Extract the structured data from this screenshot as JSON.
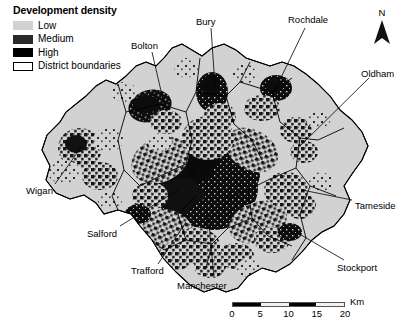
{
  "legend": {
    "title": "Development density",
    "items": [
      {
        "label": "Low",
        "swatch": "low-swatch",
        "color": "#d2d2d2"
      },
      {
        "label": "Medium",
        "swatch": "medium-swatch",
        "color": "#2a2a2a"
      },
      {
        "label": "High",
        "swatch": "high-swatch",
        "color": "#000000"
      },
      {
        "label": "District boundaries",
        "swatch": "boundary-swatch",
        "color": "#ffffff"
      }
    ]
  },
  "map": {
    "labels": [
      {
        "name": "bolton",
        "text": "Bolton"
      },
      {
        "name": "bury",
        "text": "Bury"
      },
      {
        "name": "rochdale",
        "text": "Rochdale"
      },
      {
        "name": "oldham",
        "text": "Oldham"
      },
      {
        "name": "tameside",
        "text": "Tameside"
      },
      {
        "name": "stockport",
        "text": "Stockport"
      },
      {
        "name": "manchester",
        "text": "Manchester"
      },
      {
        "name": "trafford",
        "text": "Trafford"
      },
      {
        "name": "salford",
        "text": "Salford"
      },
      {
        "name": "wigan",
        "text": "Wigan"
      }
    ]
  },
  "north_arrow": {
    "label": "N",
    "icon": "north-arrow-icon"
  },
  "scale_bar": {
    "unit": "Km",
    "ticks": [
      "0",
      "5",
      "10",
      "15",
      "20"
    ],
    "segments": [
      "dark",
      "light",
      "dark",
      "light"
    ]
  }
}
